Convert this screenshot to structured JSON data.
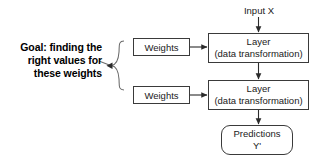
{
  "diagram": {
    "annotation": {
      "line1": "Goal: finding the",
      "line2": "right values for",
      "line3": "these weights"
    },
    "input": {
      "label": "Input X"
    },
    "weights": [
      {
        "label": "Weights"
      },
      {
        "label": "Weights"
      }
    ],
    "layers": [
      {
        "title": "Layer",
        "subtitle": "(data transformation)"
      },
      {
        "title": "Layer",
        "subtitle": "(data transformation)"
      }
    ],
    "output": {
      "line1": "Predictions",
      "line2": "Y'"
    },
    "colors": {
      "background": "#ffffff",
      "stroke": "#3a3a3a",
      "text": "#1a1a1a",
      "annotation_text": "#000000"
    }
  }
}
